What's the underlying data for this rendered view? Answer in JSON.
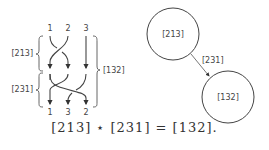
{
  "braid": {
    "top_labels": [
      "1",
      "2",
      "3"
    ],
    "bottom_labels": [
      "1",
      "3",
      "2"
    ],
    "left_brace_upper": "[213]",
    "left_brace_lower": "[231]",
    "right_brace": "[132]"
  },
  "graph": {
    "node_a": "[213]",
    "node_b": "[132]",
    "edge_label": "[231]"
  },
  "equation": "[213] ⋆ [231] = [132]."
}
